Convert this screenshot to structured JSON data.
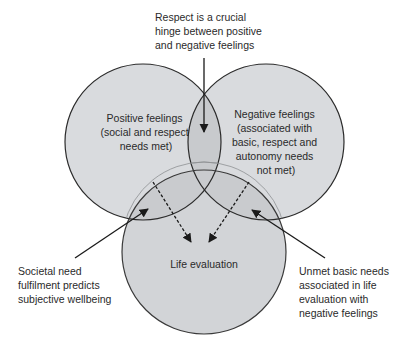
{
  "diagram": {
    "type": "venn",
    "circles": [
      {
        "id": "positive",
        "label_lines": [
          "Positive feelings",
          "(social and respect",
          "needs met)"
        ]
      },
      {
        "id": "negative",
        "label_lines": [
          "Negative feelings",
          "(associated with",
          "basic, respect and",
          "autonomy needs",
          "not met)"
        ]
      },
      {
        "id": "life",
        "label_lines": [
          "Life evaluation"
        ]
      }
    ],
    "annotations": {
      "top": [
        "Respect is a crucial",
        "hinge between positive",
        "and negative feelings"
      ],
      "bottom_left": [
        "Societal need",
        "fulfilment predicts",
        "subjective wellbeing"
      ],
      "bottom_right": [
        "Unmet basic needs",
        "associated in life",
        "evaluation with",
        "negative feelings"
      ]
    },
    "colors": {
      "circle_fill": "#d4d6d9",
      "overlap_fill": "#c4c6c9",
      "stroke": "#2b2b2b",
      "text": "#2a2a2a",
      "background": "#ffffff"
    }
  }
}
